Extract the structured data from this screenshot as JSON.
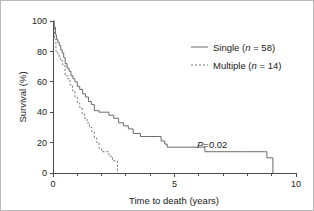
{
  "chart_data": {
    "type": "line",
    "subtype": "kaplan-meier-survival",
    "title": "",
    "xlabel": "Time to death (years)",
    "ylabel": "Survival (%)",
    "xlim": [
      0,
      10
    ],
    "ylim": [
      0,
      100
    ],
    "xticks": [
      0,
      5,
      10
    ],
    "xtick_labels": [
      "0",
      "5",
      "10"
    ],
    "xminor_ticks": [
      1,
      2,
      3,
      4,
      6,
      7,
      8,
      9
    ],
    "yticks": [
      0,
      20,
      40,
      60,
      80,
      100
    ],
    "ytick_labels": [
      "0",
      "20",
      "40",
      "60",
      "80",
      "100"
    ],
    "grid": false,
    "legend_position": "upper-right",
    "annotations": [
      {
        "name": "p-value",
        "text_prefix": "P",
        "text_value": "=0.02",
        "x": 6.3,
        "y": 17
      }
    ],
    "series": [
      {
        "name": "Single",
        "label": "Single (n = 58)",
        "n": 58,
        "style": "solid",
        "color": "#6a6a6a",
        "points": [
          [
            0.0,
            100
          ],
          [
            0.05,
            96
          ],
          [
            0.1,
            91
          ],
          [
            0.14,
            88
          ],
          [
            0.2,
            86
          ],
          [
            0.26,
            84
          ],
          [
            0.32,
            81
          ],
          [
            0.38,
            79
          ],
          [
            0.44,
            76
          ],
          [
            0.5,
            72
          ],
          [
            0.58,
            69
          ],
          [
            0.66,
            67
          ],
          [
            0.74,
            64
          ],
          [
            0.82,
            62
          ],
          [
            0.9,
            60
          ],
          [
            1.0,
            57
          ],
          [
            1.1,
            55
          ],
          [
            1.22,
            52
          ],
          [
            1.34,
            50
          ],
          [
            1.46,
            47
          ],
          [
            1.58,
            45
          ],
          [
            1.7,
            41
          ],
          [
            1.9,
            40
          ],
          [
            2.1,
            40
          ],
          [
            2.3,
            38
          ],
          [
            2.5,
            36
          ],
          [
            2.7,
            33
          ],
          [
            2.9,
            31
          ],
          [
            3.1,
            29
          ],
          [
            3.3,
            26
          ],
          [
            3.6,
            24
          ],
          [
            4.0,
            24
          ],
          [
            4.35,
            24
          ],
          [
            4.45,
            21
          ],
          [
            4.6,
            19
          ],
          [
            4.7,
            17
          ],
          [
            5.0,
            17
          ],
          [
            5.5,
            17
          ],
          [
            6.1,
            17
          ],
          [
            6.25,
            14
          ],
          [
            6.6,
            14
          ],
          [
            7.2,
            14
          ],
          [
            8.0,
            14
          ],
          [
            8.7,
            14
          ],
          [
            8.8,
            10
          ],
          [
            9.0,
            10
          ],
          [
            9.05,
            0
          ]
        ]
      },
      {
        "name": "Multiple",
        "label": "Multiple (n = 14)",
        "n": 14,
        "style": "dashed",
        "color": "#7a7a7a",
        "points": [
          [
            0.0,
            100
          ],
          [
            0.06,
            88
          ],
          [
            0.12,
            80
          ],
          [
            0.2,
            77
          ],
          [
            0.3,
            74
          ],
          [
            0.4,
            71
          ],
          [
            0.5,
            64
          ],
          [
            0.6,
            62
          ],
          [
            0.7,
            58
          ],
          [
            0.8,
            54
          ],
          [
            0.9,
            50
          ],
          [
            1.0,
            46
          ],
          [
            1.1,
            43
          ],
          [
            1.2,
            39
          ],
          [
            1.3,
            36
          ],
          [
            1.4,
            33
          ],
          [
            1.5,
            30
          ],
          [
            1.6,
            27
          ],
          [
            1.7,
            23
          ],
          [
            1.8,
            20
          ],
          [
            1.9,
            16
          ],
          [
            2.0,
            14
          ],
          [
            2.2,
            14
          ],
          [
            2.3,
            11
          ],
          [
            2.45,
            8
          ],
          [
            2.6,
            8
          ],
          [
            2.65,
            0
          ]
        ]
      }
    ]
  },
  "legend": {
    "items": [
      {
        "label": "Single (n = 58)",
        "prefix": "Single (",
        "ital": "n",
        "suffix": " = 58)",
        "style": "solid"
      },
      {
        "label": "Multiple (n = 14)",
        "prefix": "Multiple (",
        "ital": "n",
        "suffix": " = 14)",
        "style": "dashed"
      }
    ]
  },
  "axes": {
    "x_title": "Time to death (years)",
    "y_title": "Survival (%)"
  },
  "annotation": {
    "p_italic": "P",
    "p_rest": "=0.02"
  }
}
